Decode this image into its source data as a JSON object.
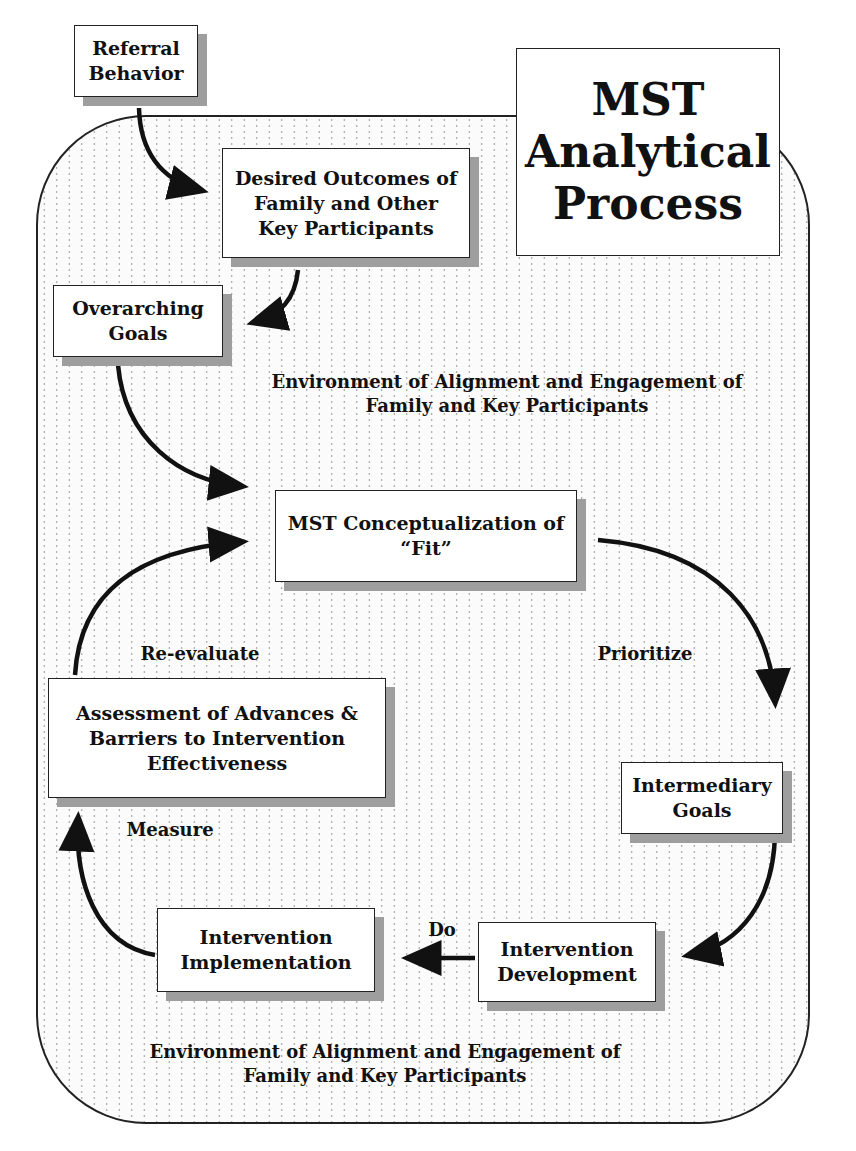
{
  "title": "MST Analytical Process",
  "title_lines": [
    "MST",
    "Analytical",
    "Process"
  ],
  "nodes": {
    "referral": "Referral Behavior",
    "desired": "Desired Outcomes of Family and Other Key Participants",
    "overarching": "Overarching Goals",
    "fit": "MST Conceptualization of “Fit”",
    "intermediary": "Intermediary Goals",
    "development": "Intervention Development",
    "implementation": "Intervention Implementation",
    "assessment": "Assessment of Advances & Barriers to Intervention Effectiveness"
  },
  "edge_labels": {
    "prioritize": "Prioritize",
    "do": "Do",
    "measure": "Measure",
    "reevaluate": "Re-evaluate"
  },
  "environment": {
    "top": "Environment of Alignment and Engagement of Family and Key Participants",
    "bottom": "Environment of Alignment and Engagement of Family and Key Participants"
  },
  "caption": "Figure 13.1 Th..."
}
